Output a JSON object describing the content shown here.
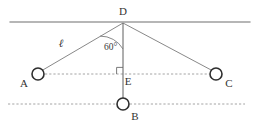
{
  "figure": {
    "background_color": "#ffffff",
    "width": 257,
    "height": 125,
    "stroke_color": "#6f6f6f",
    "node_stroke_color": "#2e2e2e",
    "dash_color": "#9a9a9a"
  },
  "labels": {
    "d": "D",
    "a": "A",
    "b": "B",
    "c": "C",
    "e": "E",
    "length": "ℓ",
    "angle": "60°"
  },
  "geometry": {
    "ceiling_line": {
      "x1": 10,
      "y1": 22,
      "x2": 250,
      "y2": 22
    },
    "pivot_d": {
      "x": 123,
      "y": 23
    },
    "node_a": {
      "x": 38,
      "y": 74,
      "r": 6
    },
    "node_b": {
      "x": 123,
      "y": 104,
      "r": 6
    },
    "node_c": {
      "x": 216,
      "y": 74,
      "r": 6
    },
    "point_e": {
      "x": 123,
      "y": 74
    },
    "horizontal_dash_line": {
      "x1": 45,
      "y1": 74,
      "x2": 209,
      "y2": 74
    },
    "lower_dash_line": {
      "x1": 8,
      "y1": 104,
      "x2": 245,
      "y2": 104
    },
    "angle_value_degrees": 60,
    "arc_radius": 26,
    "right_angle_size": 6
  },
  "positions": {
    "label_d": {
      "x": 123,
      "y": 15
    },
    "label_a": {
      "x": 24,
      "y": 87
    },
    "label_b": {
      "x": 135,
      "y": 120
    },
    "label_c": {
      "x": 229,
      "y": 87
    },
    "label_e": {
      "x": 128,
      "y": 85
    },
    "label_length": {
      "x": 61,
      "y": 47
    },
    "label_angle": {
      "x": 104,
      "y": 50
    }
  }
}
